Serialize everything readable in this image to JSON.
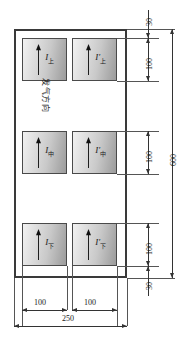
{
  "drawing": {
    "title": "sensor-array-layout",
    "annotation_flow_direction": "发气方向",
    "cells": [
      {
        "id": "upper-left",
        "label_base": "I",
        "label_prime": "",
        "label_sub": "上",
        "arrow": "up-arrow-icon"
      },
      {
        "id": "upper-right",
        "label_base": "I",
        "label_prime": "′",
        "label_sub": "上",
        "arrow": "up-arrow-icon"
      },
      {
        "id": "middle-left",
        "label_base": "I",
        "label_prime": "",
        "label_sub": "中",
        "arrow": "up-arrow-icon"
      },
      {
        "id": "middle-right",
        "label_base": "I",
        "label_prime": "′",
        "label_sub": "中",
        "arrow": "up-arrow-icon"
      },
      {
        "id": "lower-left",
        "label_base": "I",
        "label_prime": "",
        "label_sub": "下",
        "arrow": "up-arrow-icon"
      },
      {
        "id": "lower-right",
        "label_base": "I",
        "label_prime": "′",
        "label_sub": "下",
        "arrow": "up-arrow-icon"
      }
    ],
    "dimensions": {
      "top_margin": "30",
      "row_upper": "100",
      "row_middle": "100",
      "row_lower": "100",
      "bottom_margin": "30",
      "total_height": "600",
      "col_left": "100",
      "col_right": "100",
      "total_width": "250"
    },
    "colors": {
      "frame": "#3a3a3a",
      "cell_border": "#4a4a4a",
      "dimension": "#333333",
      "extension": "#555555",
      "text": "#1a1a1a",
      "background": "#ffffff"
    }
  }
}
